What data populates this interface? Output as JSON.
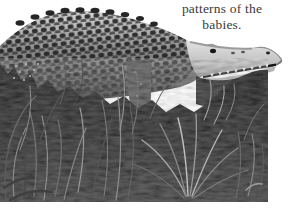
{
  "caption": {
    "line1": "patterns of the",
    "line2": "babies."
  },
  "photo": {
    "description": "Black-and-white photograph of a large crocodile resting in tall grass, facing right, snout tip extending past the photo edge",
    "monochrome": true
  },
  "colors": {
    "page_background": "#ffffff",
    "caption_text": "#3a3a3a",
    "croc_scale_dark": "#1f1f1f",
    "croc_body_mid": "#7d7d7d",
    "croc_head_light": "#d6d6d6",
    "grass_dark": "#161616",
    "grass_blade_light": "#9a9a9a",
    "teeth": "#eeeeee"
  }
}
